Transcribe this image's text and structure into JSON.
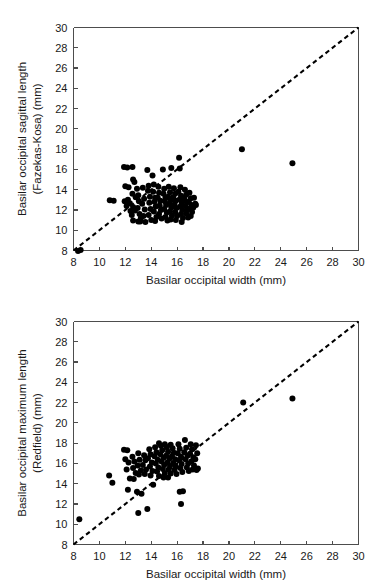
{
  "figure": {
    "background_color": "#ffffff",
    "marker_color": "#000000",
    "axis_color": "#4d4d4d",
    "reference_line_color": "#000000"
  },
  "chart_data": [
    {
      "type": "scatter",
      "panel_id": "top",
      "title": "",
      "xlabel": "Basilar occipital width  (mm)",
      "ylabel_line1": "Basilar occipital sagittal length",
      "ylabel_line2": "(Fazekas-Kosa)  (mm)",
      "xlim": [
        8,
        30
      ],
      "ylim": [
        8,
        30
      ],
      "xticks": [
        8,
        10,
        12,
        14,
        16,
        18,
        20,
        22,
        24,
        26,
        28,
        30
      ],
      "yticks": [
        8,
        10,
        12,
        14,
        16,
        18,
        20,
        22,
        24,
        26,
        28,
        30
      ],
      "grid": false,
      "legend": null,
      "annotations": [
        {
          "text": "dashed 1:1 identity line from (8,8) to (30,30)"
        }
      ],
      "reference_line": {
        "type": "identity",
        "from": [
          8,
          8
        ],
        "to": [
          30,
          30
        ],
        "style": "dashed"
      },
      "points": [
        [
          8.35,
          7.95
        ],
        [
          8.55,
          8.05
        ],
        [
          10.8,
          12.95
        ],
        [
          11.1,
          12.9
        ],
        [
          11.9,
          16.25
        ],
        [
          12.15,
          16.2
        ],
        [
          12.0,
          14.35
        ],
        [
          12.25,
          14.25
        ],
        [
          12.2,
          13.0
        ],
        [
          12.35,
          12.65
        ],
        [
          12.1,
          12.4
        ],
        [
          12.4,
          11.9
        ],
        [
          12.55,
          16.25
        ],
        [
          12.6,
          15.0
        ],
        [
          12.7,
          14.75
        ],
        [
          12.55,
          13.6
        ],
        [
          12.8,
          13.25
        ],
        [
          12.6,
          12.3
        ],
        [
          12.75,
          11.95
        ],
        [
          12.5,
          11.5
        ],
        [
          12.9,
          14.1
        ],
        [
          13.0,
          13.45
        ],
        [
          13.05,
          12.85
        ],
        [
          12.95,
          12.2
        ],
        [
          13.1,
          11.6
        ],
        [
          13.2,
          11.2
        ],
        [
          13.0,
          10.85
        ],
        [
          13.35,
          14.2
        ],
        [
          13.45,
          13.1
        ],
        [
          13.3,
          12.6
        ],
        [
          13.5,
          12.05
        ],
        [
          13.4,
          11.4
        ],
        [
          13.55,
          10.8
        ],
        [
          13.7,
          15.95
        ],
        [
          13.8,
          14.4
        ],
        [
          13.75,
          13.9
        ],
        [
          13.9,
          13.3
        ],
        [
          13.85,
          12.7
        ],
        [
          13.95,
          12.1
        ],
        [
          13.8,
          11.5
        ],
        [
          14.0,
          11.0
        ],
        [
          14.1,
          15.4
        ],
        [
          14.2,
          14.5
        ],
        [
          14.15,
          13.8
        ],
        [
          14.3,
          13.2
        ],
        [
          14.25,
          12.8
        ],
        [
          14.35,
          12.35
        ],
        [
          14.2,
          11.85
        ],
        [
          14.4,
          11.3
        ],
        [
          14.3,
          10.9
        ],
        [
          14.55,
          14.3
        ],
        [
          14.6,
          13.7
        ],
        [
          14.5,
          13.2
        ],
        [
          14.7,
          12.9
        ],
        [
          14.65,
          12.45
        ],
        [
          14.75,
          12.0
        ],
        [
          14.6,
          11.6
        ],
        [
          14.8,
          11.15
        ],
        [
          14.9,
          16.0
        ],
        [
          15.0,
          14.1
        ],
        [
          14.95,
          13.6
        ],
        [
          15.1,
          13.2
        ],
        [
          15.05,
          12.85
        ],
        [
          15.15,
          12.5
        ],
        [
          15.0,
          12.1
        ],
        [
          15.2,
          11.75
        ],
        [
          15.1,
          11.3
        ],
        [
          15.25,
          10.95
        ],
        [
          15.35,
          14.3
        ],
        [
          15.45,
          13.75
        ],
        [
          15.3,
          13.3
        ],
        [
          15.5,
          12.95
        ],
        [
          15.4,
          12.6
        ],
        [
          15.55,
          12.25
        ],
        [
          15.45,
          11.85
        ],
        [
          15.6,
          11.45
        ],
        [
          15.5,
          11.05
        ],
        [
          15.75,
          14.15
        ],
        [
          15.85,
          13.6
        ],
        [
          15.7,
          13.25
        ],
        [
          15.9,
          12.9
        ],
        [
          15.8,
          12.55
        ],
        [
          15.95,
          12.2
        ],
        [
          15.85,
          11.8
        ],
        [
          16.0,
          11.4
        ],
        [
          15.9,
          11.0
        ],
        [
          16.15,
          17.15
        ],
        [
          16.25,
          14.25
        ],
        [
          16.1,
          13.8
        ],
        [
          16.3,
          13.4
        ],
        [
          16.2,
          13.05
        ],
        [
          16.35,
          12.7
        ],
        [
          16.25,
          12.35
        ],
        [
          16.4,
          12.0
        ],
        [
          16.3,
          11.6
        ],
        [
          16.45,
          11.2
        ],
        [
          16.35,
          10.8
        ],
        [
          16.6,
          14.0
        ],
        [
          16.7,
          13.5
        ],
        [
          16.55,
          13.1
        ],
        [
          16.75,
          12.75
        ],
        [
          16.65,
          12.4
        ],
        [
          16.8,
          12.05
        ],
        [
          16.7,
          11.65
        ],
        [
          16.85,
          11.25
        ],
        [
          16.95,
          13.7
        ],
        [
          17.05,
          13.15
        ],
        [
          16.9,
          12.8
        ],
        [
          17.1,
          12.5
        ],
        [
          17.0,
          12.15
        ],
        [
          17.15,
          11.8
        ],
        [
          17.05,
          11.4
        ],
        [
          17.3,
          13.2
        ],
        [
          17.4,
          12.6
        ],
        [
          17.25,
          12.25
        ],
        [
          17.45,
          12.5
        ],
        [
          15.55,
          16.15
        ],
        [
          16.2,
          16.1
        ],
        [
          11.95,
          12.85
        ],
        [
          12.6,
          10.95
        ],
        [
          13.15,
          10.85
        ],
        [
          21.0,
          18.0
        ],
        [
          24.9,
          16.6
        ]
      ]
    },
    {
      "type": "scatter",
      "panel_id": "bottom",
      "title": "",
      "xlabel": "Basilar occipital width  (mm)",
      "ylabel_line1": "Basilar occipital maximum length",
      "ylabel_line2": "(Redfield)  (mm)",
      "xlim": [
        8,
        30
      ],
      "ylim": [
        8,
        30
      ],
      "xticks": [
        8,
        10,
        12,
        14,
        16,
        18,
        20,
        22,
        24,
        26,
        28,
        30
      ],
      "yticks": [
        8,
        10,
        12,
        14,
        16,
        18,
        20,
        22,
        24,
        26,
        28,
        30
      ],
      "grid": false,
      "legend": null,
      "annotations": [
        {
          "text": "dashed 1:1 identity line from (8,8) to (30,30)"
        }
      ],
      "reference_line": {
        "type": "identity",
        "from": [
          8,
          8
        ],
        "to": [
          30,
          30
        ],
        "style": "dashed"
      },
      "points": [
        [
          8.45,
          10.5
        ],
        [
          10.75,
          14.8
        ],
        [
          11.0,
          14.1
        ],
        [
          11.9,
          17.35
        ],
        [
          12.15,
          17.3
        ],
        [
          12.0,
          16.4
        ],
        [
          12.25,
          16.1
        ],
        [
          12.1,
          15.4
        ],
        [
          12.35,
          14.5
        ],
        [
          12.2,
          13.4
        ],
        [
          12.55,
          16.65
        ],
        [
          12.7,
          16.2
        ],
        [
          12.6,
          15.55
        ],
        [
          12.8,
          15.05
        ],
        [
          12.65,
          14.45
        ],
        [
          12.9,
          13.2
        ],
        [
          13.0,
          17.0
        ],
        [
          13.1,
          16.35
        ],
        [
          12.95,
          15.8
        ],
        [
          13.2,
          15.3
        ],
        [
          13.05,
          14.9
        ],
        [
          13.25,
          13.0
        ],
        [
          13.0,
          11.1
        ],
        [
          13.45,
          16.8
        ],
        [
          13.55,
          16.3
        ],
        [
          13.35,
          15.85
        ],
        [
          13.6,
          15.4
        ],
        [
          13.5,
          14.95
        ],
        [
          13.7,
          11.5
        ],
        [
          13.85,
          17.4
        ],
        [
          13.95,
          16.9
        ],
        [
          13.75,
          16.5
        ],
        [
          14.05,
          16.1
        ],
        [
          13.9,
          15.7
        ],
        [
          14.1,
          15.25
        ],
        [
          13.95,
          14.8
        ],
        [
          14.15,
          13.9
        ],
        [
          14.3,
          17.6
        ],
        [
          14.4,
          17.1
        ],
        [
          14.25,
          16.7
        ],
        [
          14.5,
          16.35
        ],
        [
          14.35,
          16.0
        ],
        [
          14.55,
          15.6
        ],
        [
          14.45,
          15.2
        ],
        [
          14.6,
          14.75
        ],
        [
          14.75,
          17.75
        ],
        [
          14.85,
          17.3
        ],
        [
          14.7,
          16.9
        ],
        [
          14.95,
          16.55
        ],
        [
          14.8,
          16.2
        ],
        [
          15.0,
          15.85
        ],
        [
          14.9,
          15.45
        ],
        [
          15.05,
          15.05
        ],
        [
          14.95,
          14.6
        ],
        [
          15.2,
          17.6
        ],
        [
          15.3,
          17.15
        ],
        [
          15.15,
          16.75
        ],
        [
          15.4,
          16.45
        ],
        [
          15.25,
          16.1
        ],
        [
          15.45,
          15.75
        ],
        [
          15.35,
          15.4
        ],
        [
          15.5,
          15.0
        ],
        [
          15.3,
          14.6
        ],
        [
          15.65,
          17.5
        ],
        [
          15.75,
          17.05
        ],
        [
          15.6,
          16.7
        ],
        [
          15.85,
          16.4
        ],
        [
          15.7,
          16.05
        ],
        [
          15.9,
          15.7
        ],
        [
          15.8,
          15.35
        ],
        [
          15.95,
          14.95
        ],
        [
          16.1,
          17.9
        ],
        [
          16.2,
          17.45
        ],
        [
          16.05,
          17.0
        ],
        [
          16.3,
          16.65
        ],
        [
          16.15,
          16.3
        ],
        [
          16.35,
          15.95
        ],
        [
          16.25,
          15.55
        ],
        [
          16.4,
          15.15
        ],
        [
          16.2,
          13.2
        ],
        [
          16.45,
          13.25
        ],
        [
          16.3,
          12.0
        ],
        [
          16.6,
          18.3
        ],
        [
          16.7,
          17.55
        ],
        [
          16.55,
          17.1
        ],
        [
          16.8,
          16.75
        ],
        [
          16.65,
          16.4
        ],
        [
          16.85,
          16.0
        ],
        [
          16.75,
          15.6
        ],
        [
          16.9,
          15.25
        ],
        [
          17.05,
          17.9
        ],
        [
          17.15,
          17.4
        ],
        [
          17.0,
          16.95
        ],
        [
          17.25,
          16.6
        ],
        [
          17.1,
          16.2
        ],
        [
          17.3,
          15.8
        ],
        [
          17.2,
          15.4
        ],
        [
          17.45,
          17.8
        ],
        [
          17.55,
          17.0
        ],
        [
          17.4,
          16.4
        ],
        [
          17.6,
          15.5
        ],
        [
          17.5,
          15.35
        ],
        [
          14.6,
          18.0
        ],
        [
          15.05,
          17.9
        ],
        [
          15.5,
          17.85
        ],
        [
          21.1,
          22.0
        ],
        [
          24.9,
          22.4
        ]
      ]
    }
  ]
}
